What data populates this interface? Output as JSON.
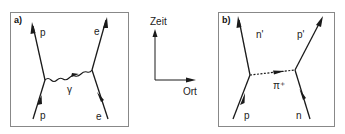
{
  "diagram": {
    "panels": [
      {
        "id": "a",
        "label": "a)",
        "particles": {
          "in_left": "p",
          "out_left": "p",
          "in_right": "e",
          "out_right": "e",
          "exchange": "γ"
        },
        "exchange_type": "photon (wavy line)"
      },
      {
        "id": "b",
        "label": "b)",
        "particles": {
          "in_left": "p",
          "out_left": "n'",
          "in_right": "n",
          "out_right": "p'",
          "exchange": "π⁺"
        },
        "exchange_type": "pion (dashed line)"
      }
    ],
    "axes": {
      "vertical_label": "Zeit",
      "horizontal_label": "Ort"
    },
    "colors": {
      "line": "#1a1a1a",
      "frame": "#888888",
      "background": "#ffffff"
    }
  }
}
